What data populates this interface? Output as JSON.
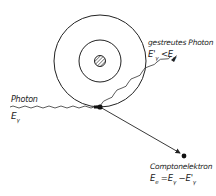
{
  "diagram": {
    "type": "compton-scattering",
    "labels": {
      "incoming_photon": "Photon",
      "incoming_energy": "Eγ",
      "scattered_photon": "gestreutes Photon",
      "scattered_energy": "E'γ < Eγ",
      "electron": "Comptonelektron",
      "electron_energy": "Ee = Eγ − E'γ"
    },
    "colors": {
      "line": "#222222",
      "background": "#ffffff"
    }
  }
}
